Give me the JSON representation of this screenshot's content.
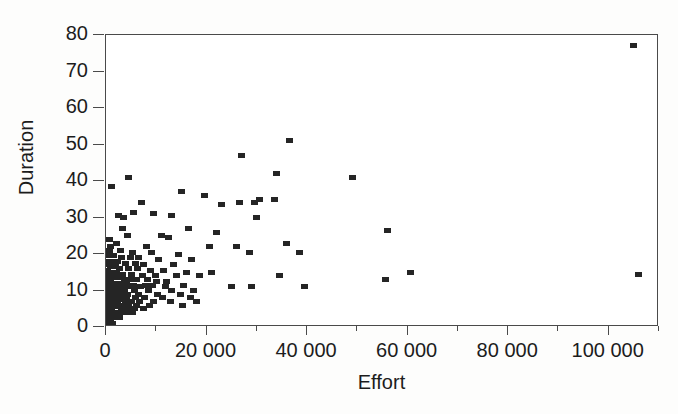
{
  "chart_data": {
    "type": "scatter",
    "title": "",
    "xlabel": "Effort",
    "ylabel": "Duration",
    "xlim": [
      0,
      110000
    ],
    "ylim": [
      0,
      80
    ],
    "grid": false,
    "legend": null,
    "xticks": [
      0,
      20000,
      40000,
      60000,
      80000,
      100000
    ],
    "xtick_labels": [
      "0",
      "20 000",
      "40 000",
      "60 000",
      "80 000",
      "100 000"
    ],
    "xticks_minor": [
      10000,
      30000,
      50000,
      70000,
      90000,
      110000
    ],
    "yticks": [
      0,
      10,
      20,
      30,
      40,
      50,
      60,
      70,
      80
    ],
    "ytick_labels": [
      "0",
      "10",
      "20",
      "30",
      "40",
      "50",
      "60",
      "70",
      "80"
    ],
    "marker": "filled-rectangle",
    "marker_color": "#252525",
    "point_count": 203,
    "points": [
      [
        105000,
        77
      ],
      [
        106000,
        14.5
      ],
      [
        56000,
        26.5
      ],
      [
        49000,
        41
      ],
      [
        60500,
        15
      ],
      [
        55500,
        13
      ],
      [
        36500,
        51
      ],
      [
        27000,
        47
      ],
      [
        34000,
        42
      ],
      [
        30500,
        35
      ],
      [
        33500,
        35
      ],
      [
        23000,
        33.5
      ],
      [
        15000,
        37
      ],
      [
        4500,
        41
      ],
      [
        1000,
        38.5
      ],
      [
        19500,
        36
      ],
      [
        26500,
        34
      ],
      [
        29500,
        34
      ],
      [
        7000,
        34
      ],
      [
        5500,
        31.5
      ],
      [
        9500,
        31
      ],
      [
        3500,
        30
      ],
      [
        2500,
        30.5
      ],
      [
        13000,
        30.5
      ],
      [
        30000,
        30
      ],
      [
        700,
        24
      ],
      [
        3200,
        27
      ],
      [
        16500,
        27
      ],
      [
        4200,
        25
      ],
      [
        11000,
        25
      ],
      [
        12500,
        24.5
      ],
      [
        22000,
        26
      ],
      [
        2000,
        23
      ],
      [
        900,
        22
      ],
      [
        8000,
        22
      ],
      [
        20500,
        22
      ],
      [
        26000,
        22
      ],
      [
        36000,
        23
      ],
      [
        600,
        21
      ],
      [
        2800,
        21
      ],
      [
        5200,
        20.5
      ],
      [
        9000,
        20.5
      ],
      [
        14500,
        20
      ],
      [
        28500,
        20.5
      ],
      [
        38500,
        20.5
      ],
      [
        400,
        19.5
      ],
      [
        1500,
        19.5
      ],
      [
        3000,
        19
      ],
      [
        4800,
        19
      ],
      [
        6500,
        19
      ],
      [
        10500,
        18.5
      ],
      [
        17000,
        18.5
      ],
      [
        300,
        18
      ],
      [
        1100,
        18
      ],
      [
        2300,
        18
      ],
      [
        3800,
        17.5
      ],
      [
        5800,
        17.5
      ],
      [
        7500,
        17
      ],
      [
        13500,
        17
      ],
      [
        250,
        17
      ],
      [
        800,
        16.5
      ],
      [
        1800,
        16.5
      ],
      [
        2600,
        16
      ],
      [
        4400,
        16
      ],
      [
        6200,
        16
      ],
      [
        8800,
        15.5
      ],
      [
        11500,
        15.5
      ],
      [
        16000,
        15
      ],
      [
        21000,
        15
      ],
      [
        200,
        15.5
      ],
      [
        650,
        15
      ],
      [
        1300,
        15
      ],
      [
        2100,
        15
      ],
      [
        3300,
        14.5
      ],
      [
        5000,
        14.5
      ],
      [
        7200,
        14
      ],
      [
        9800,
        14
      ],
      [
        14000,
        14
      ],
      [
        18500,
        14
      ],
      [
        34500,
        14
      ],
      [
        180,
        14
      ],
      [
        550,
        14
      ],
      [
        1000,
        13.5
      ],
      [
        1700,
        13.5
      ],
      [
        2400,
        13.5
      ],
      [
        3600,
        13
      ],
      [
        4600,
        13
      ],
      [
        6000,
        13
      ],
      [
        8200,
        13
      ],
      [
        10000,
        12.5
      ],
      [
        12000,
        12.5
      ],
      [
        150,
        13
      ],
      [
        500,
        12.5
      ],
      [
        950,
        12.5
      ],
      [
        1400,
        12
      ],
      [
        2200,
        12
      ],
      [
        3100,
        12
      ],
      [
        4000,
        12
      ],
      [
        5400,
        11.5
      ],
      [
        7800,
        11.5
      ],
      [
        9200,
        11.5
      ],
      [
        15500,
        11.5
      ],
      [
        120,
        12
      ],
      [
        450,
        11.5
      ],
      [
        850,
        11.5
      ],
      [
        1250,
        11
      ],
      [
        1900,
        11
      ],
      [
        2700,
        11
      ],
      [
        3400,
        11
      ],
      [
        4900,
        11
      ],
      [
        6800,
        11
      ],
      [
        11800,
        11
      ],
      [
        25000,
        11
      ],
      [
        29000,
        11
      ],
      [
        39500,
        11
      ],
      [
        100,
        11
      ],
      [
        400,
        10.5
      ],
      [
        750,
        10.5
      ],
      [
        1150,
        10.5
      ],
      [
        1600,
        10.5
      ],
      [
        2500,
        10.5
      ],
      [
        3700,
        10
      ],
      [
        5600,
        10
      ],
      [
        8500,
        10
      ],
      [
        13000,
        10
      ],
      [
        17500,
        10
      ],
      [
        90,
        10
      ],
      [
        350,
        10
      ],
      [
        700,
        9.5
      ],
      [
        1050,
        9.5
      ],
      [
        1550,
        9.5
      ],
      [
        2050,
        9.5
      ],
      [
        2900,
        9.5
      ],
      [
        4300,
        9
      ],
      [
        6400,
        9
      ],
      [
        10200,
        9
      ],
      [
        14800,
        9
      ],
      [
        80,
        9
      ],
      [
        320,
        9
      ],
      [
        620,
        9
      ],
      [
        980,
        8.5
      ],
      [
        1450,
        8.5
      ],
      [
        2150,
        8.5
      ],
      [
        3050,
        8.5
      ],
      [
        4100,
        8
      ],
      [
        5900,
        8
      ],
      [
        7600,
        8
      ],
      [
        11200,
        8
      ],
      [
        16800,
        8
      ],
      [
        70,
        8
      ],
      [
        280,
        8
      ],
      [
        560,
        8
      ],
      [
        900,
        7.5
      ],
      [
        1350,
        7.5
      ],
      [
        1950,
        7.5
      ],
      [
        2800,
        7.5
      ],
      [
        3900,
        7
      ],
      [
        5100,
        7
      ],
      [
        6700,
        7
      ],
      [
        9400,
        7
      ],
      [
        12800,
        7
      ],
      [
        18000,
        7
      ],
      [
        60,
        7
      ],
      [
        250,
        7
      ],
      [
        520,
        7
      ],
      [
        820,
        6.5
      ],
      [
        1200,
        6.5
      ],
      [
        1750,
        6.5
      ],
      [
        2350,
        6.5
      ],
      [
        3200,
        6
      ],
      [
        4500,
        6
      ],
      [
        6100,
        6
      ],
      [
        8600,
        6
      ],
      [
        15200,
        6
      ],
      [
        50,
        6
      ],
      [
        220,
        6
      ],
      [
        480,
        6
      ],
      [
        760,
        5.5
      ],
      [
        1100,
        5.5
      ],
      [
        1600,
        5.5
      ],
      [
        2250,
        5.5
      ],
      [
        3000,
        5
      ],
      [
        4200,
        5
      ],
      [
        5700,
        5
      ],
      [
        7400,
        5
      ],
      [
        45,
        5
      ],
      [
        200,
        5
      ],
      [
        430,
        4.5
      ],
      [
        700,
        4.5
      ],
      [
        1020,
        4.5
      ],
      [
        1500,
        4
      ],
      [
        2100,
        4
      ],
      [
        2950,
        4
      ],
      [
        3800,
        4
      ],
      [
        5300,
        4
      ],
      [
        40,
        4
      ],
      [
        180,
        3.5
      ],
      [
        400,
        3.5
      ],
      [
        650,
        3
      ],
      [
        960,
        3
      ],
      [
        1380,
        3
      ],
      [
        1850,
        2.5
      ],
      [
        2600,
        2.5
      ],
      [
        35,
        2.5
      ],
      [
        160,
        2
      ],
      [
        360,
        2
      ],
      [
        600,
        1.5
      ],
      [
        880,
        1.5
      ],
      [
        1300,
        1
      ],
      [
        30,
        1
      ],
      [
        140,
        0.8
      ]
    ]
  }
}
